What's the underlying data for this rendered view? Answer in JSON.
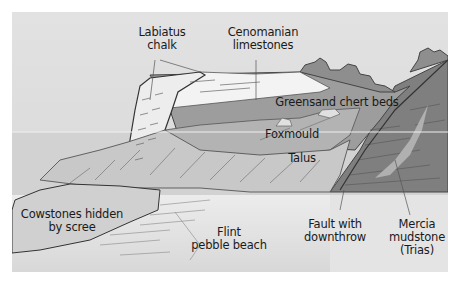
{
  "diagram": {
    "colors": {
      "sky": "#dcdcdc",
      "sea": "#cfcfcf",
      "beach": "#e6e6e6",
      "chalk": "#eeeeee",
      "cenomanian": "#f3f3f3",
      "greensand": "#9d9d9d",
      "foxmould": "#b0b0b0",
      "talus": "#c6c6c6",
      "mercia": "#7d7d7d",
      "vegetation": "#909090",
      "line": "#444444"
    },
    "labels": {
      "labiatus_line1": "Labiatus",
      "labiatus_line2": "chalk",
      "cenomanian_line1": "Cenomanian",
      "cenomanian_line2": "limestones",
      "greensand": "Greensand chert beds",
      "foxmould": "Foxmould",
      "talus": "Talus",
      "cowstones_line1": "Cowstones hidden",
      "cowstones_line2": "by scree",
      "flint_line1": "Flint",
      "flint_line2": "pebble beach",
      "fault_line1": "Fault with",
      "fault_line2": "downthrow",
      "mercia_line1": "Mercia",
      "mercia_line2": "mudstone",
      "mercia_line3": "(Trias)"
    }
  }
}
